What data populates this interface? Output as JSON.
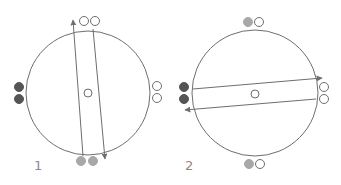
{
  "colors": {
    "stroke": "#6e6e6e",
    "dark_ball": "#555555",
    "gray_ball": "#a8a8a8",
    "open_ball": "#ffffff"
  },
  "diagrams": [
    {
      "label": "1",
      "circle": {
        "cx": 88,
        "cy": 93,
        "r": 62
      },
      "center_marker": {
        "cx": 88,
        "cy": 93,
        "r": 4
      },
      "balls": [
        {
          "position": "top",
          "fill": "open",
          "cx": 84,
          "cy": 21
        },
        {
          "position": "top",
          "fill": "open",
          "cx": 95,
          "cy": 21
        },
        {
          "position": "bottom",
          "fill": "gray",
          "cx": 81,
          "cy": 161
        },
        {
          "position": "bottom",
          "fill": "gray",
          "cx": 93,
          "cy": 161
        },
        {
          "position": "left",
          "fill": "dark",
          "cx": 19,
          "cy": 87
        },
        {
          "position": "left",
          "fill": "dark",
          "cx": 19,
          "cy": 99
        },
        {
          "position": "right",
          "fill": "open",
          "cx": 157,
          "cy": 86
        },
        {
          "position": "right",
          "fill": "open",
          "cx": 157,
          "cy": 98
        }
      ],
      "arrows": [
        {
          "x1": 83,
          "y1": 156,
          "x2": 73,
          "y2": 20,
          "direction": "up"
        },
        {
          "x1": 93,
          "y1": 29,
          "x2": 105,
          "y2": 159,
          "direction": "down"
        }
      ]
    },
    {
      "label": "2",
      "circle": {
        "cx": 255,
        "cy": 93,
        "r": 63
      },
      "center_marker": {
        "cx": 255,
        "cy": 94,
        "r": 4
      },
      "balls": [
        {
          "position": "top",
          "fill": "gray",
          "cx": 248,
          "cy": 22
        },
        {
          "position": "top",
          "fill": "open",
          "cx": 259,
          "cy": 22
        },
        {
          "position": "bottom",
          "fill": "gray",
          "cx": 249,
          "cy": 164
        },
        {
          "position": "bottom",
          "fill": "open",
          "cx": 260,
          "cy": 164
        },
        {
          "position": "left",
          "fill": "dark",
          "cx": 184,
          "cy": 87
        },
        {
          "position": "left",
          "fill": "dark",
          "cx": 184,
          "cy": 99
        },
        {
          "position": "right",
          "fill": "open",
          "cx": 324,
          "cy": 87
        },
        {
          "position": "right",
          "fill": "open",
          "cx": 324,
          "cy": 99
        }
      ],
      "arrows": [
        {
          "x1": 193,
          "y1": 89,
          "x2": 322,
          "y2": 78,
          "direction": "right"
        },
        {
          "x1": 316,
          "y1": 99,
          "x2": 185,
          "y2": 110,
          "direction": "left"
        }
      ]
    }
  ]
}
